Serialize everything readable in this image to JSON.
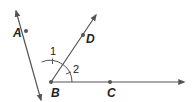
{
  "diagram": {
    "type": "angle-diagram",
    "vertex": {
      "label": "B",
      "x": 51,
      "y": 82
    },
    "rays": [
      {
        "name": "BA",
        "through": "A",
        "point": {
          "label": "A",
          "x": 26,
          "y": 31
        },
        "arrow_end": {
          "x": 16,
          "y": 11
        }
      },
      {
        "name": "BD",
        "through": "D",
        "point": {
          "label": "D",
          "x": 83,
          "y": 35
        },
        "arrow_end": {
          "x": 96,
          "y": 15
        }
      },
      {
        "name": "BC",
        "through": "C",
        "point": {
          "label": "C",
          "x": 110,
          "y": 82
        },
        "arrow_end": {
          "x": 184,
          "y": 82
        }
      }
    ],
    "opposite_ray_end": {
      "x": 41,
      "y": 100
    },
    "angles": [
      {
        "label": "1",
        "between": [
          "BA",
          "BD"
        ],
        "tick_marks": 1
      },
      {
        "label": "2",
        "between": [
          "BD",
          "BC"
        ],
        "tick_marks": 1
      }
    ],
    "colors": {
      "line": "#555555",
      "point": "#555555",
      "text": "#222222"
    }
  }
}
